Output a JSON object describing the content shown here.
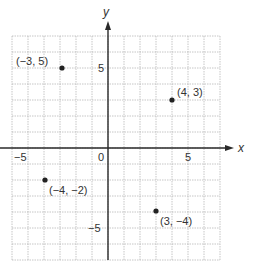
{
  "figure": {
    "type": "coordinate-plane",
    "x_axis_label": "x",
    "y_axis_label": "y",
    "origin_label": "0",
    "tick_labels": {
      "x_neg": "−5",
      "x_pos": "5",
      "y_pos": "5",
      "y_neg": "−5"
    },
    "grid": {
      "x_min": -6,
      "x_max": 7,
      "y_min": -7,
      "y_max": 7,
      "step": 1
    },
    "points": [
      {
        "x": -3,
        "y": 5,
        "label": "(−3, 5)"
      },
      {
        "x": 4,
        "y": 3,
        "label": "(4, 3)"
      },
      {
        "x": -4,
        "y": -2,
        "label": "(−4, −2)"
      },
      {
        "x": 3,
        "y": -4,
        "label": "(3, −4)"
      }
    ]
  }
}
